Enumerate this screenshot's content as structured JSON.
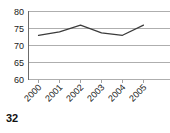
{
  "page": {
    "number": "32"
  },
  "chart_data": {
    "type": "line",
    "title": "",
    "subtitle": "",
    "xlabel": "",
    "ylabel": "",
    "categories": [
      "2000",
      "2001",
      "2002",
      "2003",
      "2004",
      "2005"
    ],
    "values": [
      73,
      74,
      76,
      73.7,
      73,
      76
    ],
    "series": [
      {
        "name": "",
        "values": [
          73,
          74,
          76,
          73.7,
          73,
          76
        ],
        "color": "#3b3b3b"
      }
    ],
    "ylim": [
      60,
      80
    ],
    "yticks": [
      60,
      65,
      70,
      75,
      80
    ],
    "ytick_labels": [
      "60",
      "65",
      "70",
      "75",
      "80"
    ],
    "xtick_labels": [
      "2000",
      "2001",
      "2002",
      "2003",
      "2004",
      "2005"
    ],
    "xtick_label_rotation": 45,
    "grid": true,
    "grid_axis": "y",
    "grid_color": "#9a9a9a",
    "legend": false,
    "legend_position": "none",
    "markers": false,
    "background_color": "#ffffff"
  }
}
